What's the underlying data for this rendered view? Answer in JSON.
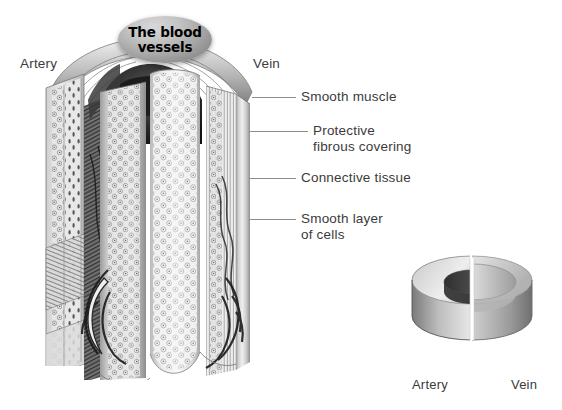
{
  "figure": {
    "title": "The blood\nvessels",
    "background_color": "#ffffff",
    "ink_color": "#3b3b3b",
    "leader_color": "#8d8d8d"
  },
  "main_diagram": {
    "name": "cut-away blood vessel wall illustration",
    "top_labels": [
      {
        "text": "Artery",
        "side": "left"
      },
      {
        "text": "Vein",
        "side": "right"
      }
    ],
    "callouts": [
      {
        "text": "Smooth muscle"
      },
      {
        "text": "Protective\nfibrous covering"
      },
      {
        "text": "Connective tissue"
      },
      {
        "text": "Smooth layer\nof cells"
      }
    ]
  },
  "inset_diagram": {
    "name": "artery vs vein wall thickness cross-section",
    "labels": [
      {
        "text": "Artery",
        "side": "left"
      },
      {
        "text": "Vein",
        "side": "right"
      }
    ]
  }
}
